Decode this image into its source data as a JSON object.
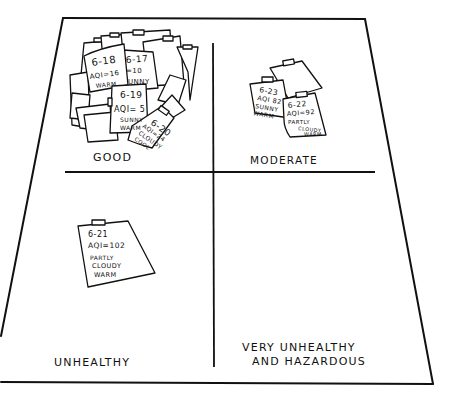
{
  "diagram": {
    "type": "hand-drawn quadrant poster",
    "quadrants": [
      {
        "id": "good",
        "label": "GOOD",
        "cards": [
          {
            "date": "6-18",
            "aqi": "AQI=16",
            "weather": [
              "WARM"
            ]
          },
          {
            "date": "6-17",
            "aqi": "=10",
            "weather": [
              "UNNY"
            ]
          },
          {
            "date": "6-19",
            "aqi": "AQI= 5",
            "weather": [
              "SUNNY",
              "WARM"
            ]
          },
          {
            "date": "6-20",
            "aqi": "AQI=24",
            "weather": [
              "CLOUDY",
              "COOL"
            ]
          }
        ]
      },
      {
        "id": "moderate",
        "label": "MODERATE",
        "cards": [
          {
            "date": "6-23",
            "aqi": "AQI 82",
            "weather": [
              "SUNNY",
              "WARM"
            ]
          },
          {
            "date": "6-22",
            "aqi": "AQI=92",
            "weather": [
              "PARTLY",
              "CLOUDY",
              "WARM"
            ]
          }
        ]
      },
      {
        "id": "unhealthy",
        "label": "UNHEALTHY",
        "cards": [
          {
            "date": "6-21",
            "aqi": "AQI=102",
            "weather": [
              "PARTLY",
              "CLOUDY",
              "WARM"
            ]
          }
        ]
      },
      {
        "id": "very-unhealthy",
        "label_lines": [
          "VERY UNHEALTHY",
          "AND HAZARDOUS"
        ],
        "cards": []
      }
    ],
    "colors": {
      "ink": "#111111",
      "paper": "#ffffff"
    }
  }
}
